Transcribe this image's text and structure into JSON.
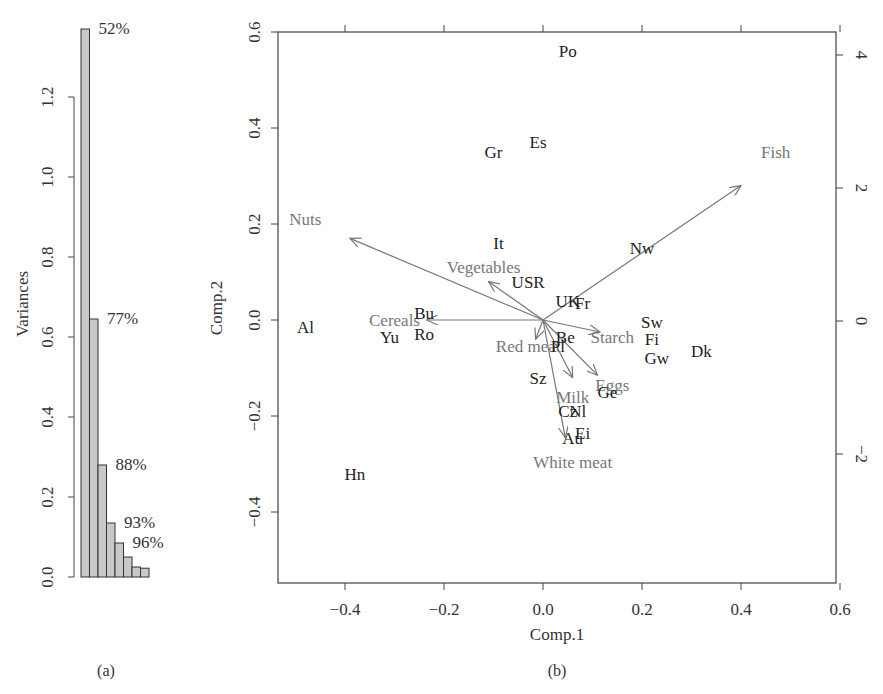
{
  "chart_data": [
    {
      "id": "a",
      "type": "bar",
      "panel_label": "(a)",
      "title": "",
      "xlabel": "",
      "ylabel": "Variances",
      "ylim": [
        0,
        1.4
      ],
      "yticks": [
        "0.0",
        "0.2",
        "0.4",
        "0.6",
        "0.8",
        "1.0",
        "1.2"
      ],
      "categories": [
        "Comp.1",
        "Comp.2",
        "Comp.3",
        "Comp.4",
        "Comp.5",
        "Comp.6",
        "Comp.7",
        "Comp.8"
      ],
      "values": [
        1.37,
        0.645,
        0.28,
        0.135,
        0.085,
        0.05,
        0.025,
        0.022
      ],
      "bar_color": "#c8c8c8",
      "annotations": [
        {
          "bar": 0,
          "text": "52%"
        },
        {
          "bar": 1,
          "text": "77%"
        },
        {
          "bar": 2,
          "text": "88%"
        },
        {
          "bar": 3,
          "text": "93%"
        },
        {
          "bar": 4,
          "text": "96%"
        }
      ],
      "grid": false
    },
    {
      "id": "b",
      "type": "scatter",
      "subtype": "biplot",
      "panel_label": "(b)",
      "title": "",
      "xlabel": "Comp.1",
      "ylabel": "Comp.2",
      "xlim": [
        -0.53,
        0.6
      ],
      "ylim": [
        -0.55,
        0.6
      ],
      "xticks": [
        "-0.4",
        "-0.2",
        "0.0",
        "0.2",
        "0.4",
        "0.6"
      ],
      "yticks": [
        "-0.4",
        "-0.2",
        "0.0",
        "0.2",
        "0.4",
        "0.6"
      ],
      "right_axis_ticks": [
        "-2",
        "0",
        "2",
        "4"
      ],
      "grid": false,
      "points": [
        {
          "label": "Po",
          "x": 0.05,
          "y": 0.56
        },
        {
          "label": "Es",
          "x": -0.01,
          "y": 0.37
        },
        {
          "label": "Gr",
          "x": -0.1,
          "y": 0.35
        },
        {
          "label": "It",
          "x": -0.09,
          "y": 0.16
        },
        {
          "label": "Nw",
          "x": 0.2,
          "y": 0.15
        },
        {
          "label": "USR",
          "x": -0.03,
          "y": 0.08
        },
        {
          "label": "UK",
          "x": 0.05,
          "y": 0.04
        },
        {
          "label": "Fr",
          "x": 0.08,
          "y": 0.035
        },
        {
          "label": "Bu",
          "x": -0.24,
          "y": 0.015
        },
        {
          "label": "Sw",
          "x": 0.22,
          "y": -0.005
        },
        {
          "label": "Al",
          "x": -0.48,
          "y": -0.015
        },
        {
          "label": "Ro",
          "x": -0.24,
          "y": -0.03
        },
        {
          "label": "Yu",
          "x": -0.31,
          "y": -0.035
        },
        {
          "label": "Be",
          "x": 0.045,
          "y": -0.035
        },
        {
          "label": "Fi",
          "x": 0.22,
          "y": -0.04
        },
        {
          "label": "Pl",
          "x": 0.03,
          "y": -0.055
        },
        {
          "label": "Dk",
          "x": 0.32,
          "y": -0.065
        },
        {
          "label": "Gw",
          "x": 0.23,
          "y": -0.08
        },
        {
          "label": "Sz",
          "x": -0.01,
          "y": -0.12
        },
        {
          "label": "Ge",
          "x": 0.13,
          "y": -0.15
        },
        {
          "label": "Cz",
          "x": 0.05,
          "y": -0.19
        },
        {
          "label": "Nl",
          "x": 0.07,
          "y": -0.19
        },
        {
          "label": "Ei",
          "x": 0.08,
          "y": -0.235
        },
        {
          "label": "Au",
          "x": 0.06,
          "y": -0.245
        },
        {
          "label": "Hn",
          "x": -0.38,
          "y": -0.32
        }
      ],
      "loadings": [
        {
          "label": "Fish",
          "x": 0.4,
          "y": 0.28,
          "label_x": 0.47,
          "label_y": 0.35
        },
        {
          "label": "Nuts",
          "x": -0.39,
          "y": 0.17,
          "label_x": -0.48,
          "label_y": 0.21
        },
        {
          "label": "Vegetables",
          "x": -0.11,
          "y": 0.08,
          "label_x": -0.12,
          "label_y": 0.11
        },
        {
          "label": "Cereals",
          "x": -0.235,
          "y": 0.0,
          "label_x": -0.3,
          "label_y": 0.0
        },
        {
          "label": "Starch",
          "x": 0.115,
          "y": -0.025,
          "label_x": 0.14,
          "label_y": -0.035
        },
        {
          "label": "Red meat",
          "x": -0.015,
          "y": -0.04,
          "label_x": -0.03,
          "label_y": -0.055
        },
        {
          "label": "Eggs",
          "x": 0.11,
          "y": -0.115,
          "label_x": 0.14,
          "label_y": -0.135
        },
        {
          "label": "Milk",
          "x": 0.06,
          "y": -0.12,
          "label_x": 0.06,
          "label_y": -0.16
        },
        {
          "label": "White meat",
          "x": 0.045,
          "y": -0.245,
          "label_x": 0.06,
          "label_y": -0.295
        }
      ],
      "point_color": "#222222",
      "loading_color": "#777777"
    }
  ]
}
